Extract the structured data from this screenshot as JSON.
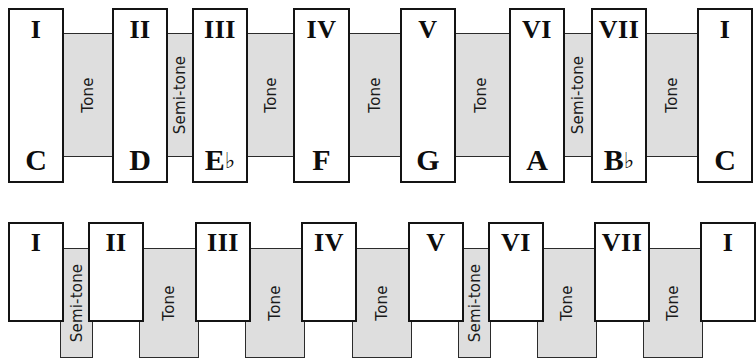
{
  "diagram": {
    "colors": {
      "interval_fill": "#dedede",
      "box_fill": "#ffffff",
      "outline": "#141414",
      "text": "#0d0d0d"
    },
    "rows": [
      {
        "id": "row-top",
        "name": "c-minor-scale-row",
        "degrees": [
          {
            "numeral": "I",
            "note": "C",
            "accidental": ""
          },
          {
            "numeral": "II",
            "note": "D",
            "accidental": ""
          },
          {
            "numeral": "III",
            "note": "E",
            "accidental": "♭"
          },
          {
            "numeral": "IV",
            "note": "F",
            "accidental": ""
          },
          {
            "numeral": "V",
            "note": "G",
            "accidental": ""
          },
          {
            "numeral": "VI",
            "note": "A",
            "accidental": ""
          },
          {
            "numeral": "VII",
            "note": "B",
            "accidental": "♭"
          },
          {
            "numeral": "I",
            "note": "C",
            "accidental": ""
          }
        ],
        "intervals": [
          {
            "label": "Tone"
          },
          {
            "label": "Semi-tone"
          },
          {
            "label": "Tone"
          },
          {
            "label": "Tone"
          },
          {
            "label": "Tone"
          },
          {
            "label": "Semi-tone"
          },
          {
            "label": "Tone"
          }
        ]
      },
      {
        "id": "row-bottom",
        "name": "second-scale-row-clipped",
        "degrees": [
          {
            "numeral": "I",
            "note": "",
            "accidental": ""
          },
          {
            "numeral": "II",
            "note": "",
            "accidental": ""
          },
          {
            "numeral": "III",
            "note": "",
            "accidental": ""
          },
          {
            "numeral": "IV",
            "note": "",
            "accidental": ""
          },
          {
            "numeral": "V",
            "note": "",
            "accidental": ""
          },
          {
            "numeral": "VI",
            "note": "",
            "accidental": ""
          },
          {
            "numeral": "VII",
            "note": "",
            "accidental": ""
          },
          {
            "numeral": "I",
            "note": "",
            "accidental": ""
          }
        ],
        "intervals": [
          {
            "label": "Semi-tone"
          },
          {
            "label": "Tone"
          },
          {
            "label": "Tone"
          },
          {
            "label": "Tone"
          },
          {
            "label": "Semi-tone"
          },
          {
            "label": "Tone"
          },
          {
            "label": "Tone"
          }
        ]
      }
    ]
  }
}
